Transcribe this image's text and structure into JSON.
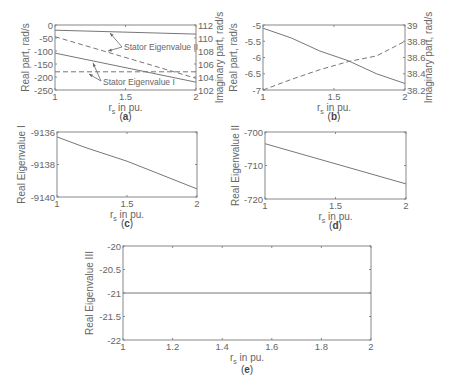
{
  "chart_data": [
    {
      "id": "a",
      "type": "line",
      "caption": "a",
      "xlabel": "r_s in pu.",
      "ylabel": "Real part, rad/s",
      "ylabel_right": "Imaginary part, rad/s",
      "xlim": [
        1,
        2
      ],
      "ylim": [
        -250,
        0
      ],
      "ylim_right": [
        102,
        112
      ],
      "xticks": [
        "1",
        "1.5",
        "2"
      ],
      "yticks": [
        "0",
        "-50",
        "-100",
        "-150",
        "-200",
        "-250"
      ],
      "yticks_right": [
        "112",
        "110",
        "108",
        "106",
        "104",
        "102"
      ],
      "annotations": [
        "Stator Eigenvalue II",
        "Stator Eigenvalue I"
      ],
      "series": [
        {
          "name": "Stator Eigenvalue II real",
          "axis": "left",
          "style": "solid",
          "x": [
            1,
            2
          ],
          "values": [
            -20,
            -35
          ]
        },
        {
          "name": "Stator Eigenvalue II imaginary",
          "axis": "right",
          "style": "dashed",
          "x": [
            1,
            2
          ],
          "values": [
            110.2,
            103.8
          ]
        },
        {
          "name": "Stator Eigenvalue I real",
          "axis": "left",
          "style": "solid",
          "x": [
            1,
            2
          ],
          "values": [
            -108,
            -220
          ]
        },
        {
          "name": "Stator Eigenvalue I imaginary",
          "axis": "right",
          "style": "dashed",
          "x": [
            1,
            2
          ],
          "values": [
            104.8,
            104.8
          ]
        }
      ]
    },
    {
      "id": "b",
      "type": "line",
      "caption": "b",
      "xlabel": "r_s in pu.",
      "ylabel": "Real part, rad/s",
      "ylabel_right": "Imaginary part, rad/s",
      "xlim": [
        1,
        2
      ],
      "ylim": [
        -7,
        -5
      ],
      "ylim_right": [
        38.2,
        39
      ],
      "xticks": [
        "1",
        "1.5",
        "2"
      ],
      "yticks": [
        "-5",
        "-5.5",
        "-6",
        "-6.5",
        "-7"
      ],
      "yticks_right": [
        "39",
        "38.8",
        "38.6",
        "38.4",
        "38.2"
      ],
      "series": [
        {
          "name": "Real part",
          "axis": "left",
          "style": "solid",
          "x": [
            1,
            1.2,
            1.4,
            1.6,
            1.8,
            2
          ],
          "values": [
            -5.1,
            -5.4,
            -5.8,
            -6.1,
            -6.5,
            -6.8
          ]
        },
        {
          "name": "Imaginary part",
          "axis": "right",
          "style": "dashed",
          "x": [
            1,
            1.2,
            1.4,
            1.6,
            1.8,
            2
          ],
          "values": [
            38.2,
            38.33,
            38.45,
            38.55,
            38.62,
            38.8
          ]
        }
      ]
    },
    {
      "id": "c",
      "type": "line",
      "caption": "c",
      "xlabel": "r_s in pu.",
      "ylabel": "Real Eigenvalue I",
      "xlim": [
        1,
        2
      ],
      "ylim": [
        -9140,
        -9136
      ],
      "xticks": [
        "1",
        "1.5",
        "2"
      ],
      "yticks": [
        "-9136",
        "-9138",
        "-9140"
      ],
      "series": [
        {
          "name": "Real Eigenvalue I",
          "style": "solid",
          "x": [
            1,
            1.2,
            1.5,
            2
          ],
          "values": [
            -9136.3,
            -9136.95,
            -9137.8,
            -9139.5
          ]
        }
      ]
    },
    {
      "id": "d",
      "type": "line",
      "caption": "d",
      "xlabel": "r_s in pu.",
      "ylabel": "Real Eigenvalue II",
      "xlim": [
        1,
        2
      ],
      "ylim": [
        -720,
        -700
      ],
      "xticks": [
        "1",
        "1.5",
        "2"
      ],
      "yticks": [
        "-700",
        "-710",
        "-720"
      ],
      "series": [
        {
          "name": "Real Eigenvalue II",
          "style": "solid",
          "x": [
            1,
            2
          ],
          "values": [
            -703.5,
            -715.5
          ]
        }
      ]
    },
    {
      "id": "e",
      "type": "line",
      "caption": "e",
      "xlabel": "r_s in pu.",
      "ylabel": "Real Eigenvalue III",
      "xlim": [
        1,
        2
      ],
      "ylim": [
        -22,
        -20
      ],
      "xticks": [
        "1",
        "1.2",
        "1.4",
        "1.6",
        "1.8",
        "2"
      ],
      "yticks": [
        "-20",
        "-20.5",
        "-21",
        "-21.5",
        "-22"
      ],
      "series": [
        {
          "name": "Real Eigenvalue III",
          "style": "solid",
          "x": [
            1,
            2
          ],
          "values": [
            -21,
            -21
          ]
        }
      ]
    }
  ],
  "colors": {
    "line": "#777777",
    "axis": "#888888",
    "text": "#666666"
  }
}
